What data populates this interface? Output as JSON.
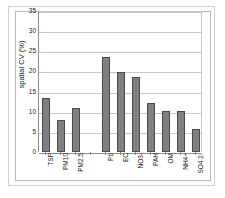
{
  "chart_data": {
    "type": "bar",
    "title": "",
    "subtitle": "",
    "xlabel": "",
    "ylabel": "spatial CV (%)",
    "categories": [
      "TSP",
      "PM10",
      "PM2.5",
      "",
      "Pb",
      "EC",
      "NO3-",
      "PAH",
      "OM",
      "NH4+",
      "SO4 2-"
    ],
    "values": [
      13.5,
      8.0,
      11.0,
      null,
      23.5,
      19.9,
      18.7,
      12.1,
      10.3,
      10.1,
      5.8
    ],
    "ylim": [
      0,
      35
    ],
    "yticks": [
      0,
      5,
      10,
      15,
      20,
      25,
      30,
      35
    ],
    "ytick_labels": [
      "0",
      "5",
      "10",
      "15",
      "20",
      "25",
      "30",
      "35"
    ],
    "grid": "horizontal",
    "legend": "none",
    "bar_color": "#808080",
    "bar_edge_color": "#4a4a4a",
    "plot_background": "#ffffff",
    "gridline_color": "#c8c8c8",
    "axis_color": "#8d8d8d",
    "xtick_label_rotation": -90
  }
}
